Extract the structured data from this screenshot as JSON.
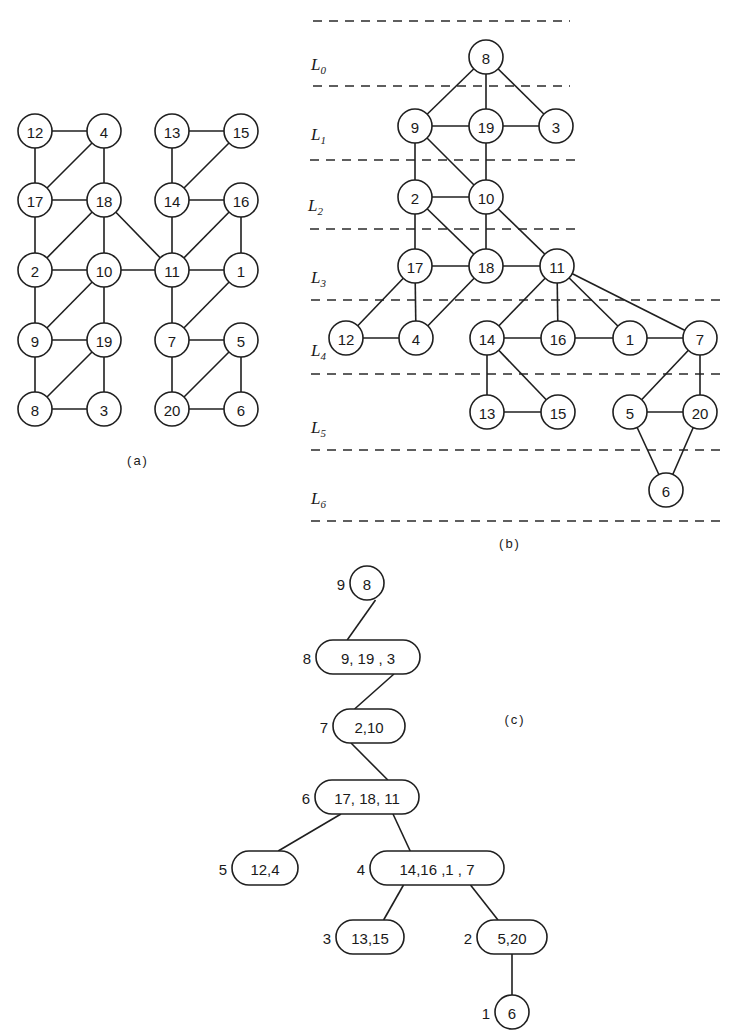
{
  "figure": {
    "panel_a": {
      "caption": "(a)",
      "node_radius": 17,
      "nodes": [
        {
          "id": "12",
          "x": 35,
          "y": 131
        },
        {
          "id": "4",
          "x": 104,
          "y": 131
        },
        {
          "id": "13",
          "x": 172,
          "y": 131
        },
        {
          "id": "15",
          "x": 241,
          "y": 131
        },
        {
          "id": "17",
          "x": 35,
          "y": 200
        },
        {
          "id": "18",
          "x": 104,
          "y": 200
        },
        {
          "id": "14",
          "x": 172,
          "y": 200
        },
        {
          "id": "16",
          "x": 241,
          "y": 200
        },
        {
          "id": "2",
          "x": 35,
          "y": 270
        },
        {
          "id": "10",
          "x": 104,
          "y": 270
        },
        {
          "id": "11",
          "x": 172,
          "y": 270
        },
        {
          "id": "1",
          "x": 241,
          "y": 270
        },
        {
          "id": "9",
          "x": 35,
          "y": 340
        },
        {
          "id": "19",
          "x": 104,
          "y": 340
        },
        {
          "id": "7",
          "x": 172,
          "y": 340
        },
        {
          "id": "5",
          "x": 241,
          "y": 340
        },
        {
          "id": "8",
          "x": 35,
          "y": 409
        },
        {
          "id": "3",
          "x": 104,
          "y": 409
        },
        {
          "id": "20",
          "x": 172,
          "y": 409
        },
        {
          "id": "6",
          "x": 241,
          "y": 409
        }
      ],
      "edges": [
        [
          "12",
          "4"
        ],
        [
          "12",
          "17"
        ],
        [
          "4",
          "17"
        ],
        [
          "4",
          "18"
        ],
        [
          "13",
          "15"
        ],
        [
          "13",
          "14"
        ],
        [
          "15",
          "14"
        ],
        [
          "17",
          "18"
        ],
        [
          "17",
          "2"
        ],
        [
          "18",
          "2"
        ],
        [
          "18",
          "10"
        ],
        [
          "18",
          "11"
        ],
        [
          "14",
          "16"
        ],
        [
          "14",
          "11"
        ],
        [
          "16",
          "11"
        ],
        [
          "16",
          "1"
        ],
        [
          "2",
          "10"
        ],
        [
          "2",
          "9"
        ],
        [
          "10",
          "11"
        ],
        [
          "10",
          "9"
        ],
        [
          "10",
          "19"
        ],
        [
          "11",
          "1"
        ],
        [
          "11",
          "7"
        ],
        [
          "1",
          "7"
        ],
        [
          "9",
          "19"
        ],
        [
          "9",
          "8"
        ],
        [
          "19",
          "8"
        ],
        [
          "19",
          "3"
        ],
        [
          "8",
          "3"
        ],
        [
          "7",
          "5"
        ],
        [
          "7",
          "20"
        ],
        [
          "5",
          "20"
        ],
        [
          "5",
          "6"
        ],
        [
          "20",
          "6"
        ]
      ],
      "caption_pos": {
        "x": 138,
        "y": 465
      }
    },
    "panel_b": {
      "caption": "(b)",
      "caption_pos": {
        "x": 510,
        "y": 548
      },
      "node_radius": 17,
      "level_lines_y": [
        21,
        86,
        160,
        229,
        300,
        374,
        450,
        521
      ],
      "level_lines": [
        {
          "y": 21,
          "x1": 313,
          "x2": 570
        },
        {
          "y": 86,
          "x1": 313,
          "x2": 570
        },
        {
          "y": 160,
          "x1": 310,
          "x2": 578
        },
        {
          "y": 229,
          "x1": 310,
          "x2": 575
        },
        {
          "y": 300,
          "x1": 311,
          "x2": 720
        },
        {
          "y": 374,
          "x1": 311,
          "x2": 720
        },
        {
          "y": 450,
          "x1": 311,
          "x2": 720
        },
        {
          "y": 521,
          "x1": 311,
          "x2": 720
        }
      ],
      "levels": [
        {
          "label": "L",
          "sub": "0",
          "x": 311,
          "y": 70
        },
        {
          "label": "L",
          "sub": "1",
          "x": 311,
          "y": 140
        },
        {
          "label": "L",
          "sub": "2",
          "x": 308,
          "y": 211
        },
        {
          "label": "L",
          "sub": "3",
          "x": 311,
          "y": 283
        },
        {
          "label": "L",
          "sub": "4",
          "x": 311,
          "y": 356
        },
        {
          "label": "L",
          "sub": "5",
          "x": 311,
          "y": 433
        },
        {
          "label": "L",
          "sub": "6",
          "x": 311,
          "y": 504
        }
      ],
      "nodes": [
        {
          "id": "8",
          "x": 486,
          "y": 57
        },
        {
          "id": "9",
          "x": 415,
          "y": 126
        },
        {
          "id": "19",
          "x": 486,
          "y": 126
        },
        {
          "id": "3",
          "x": 556,
          "y": 126
        },
        {
          "id": "2",
          "x": 415,
          "y": 197
        },
        {
          "id": "10",
          "x": 486,
          "y": 197
        },
        {
          "id": "17",
          "x": 415,
          "y": 266
        },
        {
          "id": "18",
          "x": 486,
          "y": 266
        },
        {
          "id": "11",
          "x": 557,
          "y": 266
        },
        {
          "id": "12",
          "x": 346,
          "y": 338
        },
        {
          "id": "4",
          "x": 416,
          "y": 338
        },
        {
          "id": "14",
          "x": 487,
          "y": 338
        },
        {
          "id": "16",
          "x": 558,
          "y": 338
        },
        {
          "id": "1",
          "x": 630,
          "y": 338
        },
        {
          "id": "7",
          "x": 700,
          "y": 338
        },
        {
          "id": "13",
          "x": 487,
          "y": 412
        },
        {
          "id": "15",
          "x": 558,
          "y": 412
        },
        {
          "id": "5",
          "x": 630,
          "y": 412
        },
        {
          "id": "20",
          "x": 700,
          "y": 412
        },
        {
          "id": "6",
          "x": 666,
          "y": 490
        }
      ],
      "edges": [
        [
          "8",
          "9"
        ],
        [
          "8",
          "19"
        ],
        [
          "8",
          "3"
        ],
        [
          "9",
          "19"
        ],
        [
          "19",
          "3"
        ],
        [
          "9",
          "2"
        ],
        [
          "9",
          "10"
        ],
        [
          "19",
          "10"
        ],
        [
          "2",
          "10"
        ],
        [
          "2",
          "17"
        ],
        [
          "2",
          "18"
        ],
        [
          "10",
          "18"
        ],
        [
          "10",
          "11"
        ],
        [
          "17",
          "18"
        ],
        [
          "18",
          "11"
        ],
        [
          "17",
          "12"
        ],
        [
          "17",
          "4"
        ],
        [
          "18",
          "4"
        ],
        [
          "11",
          "14"
        ],
        [
          "11",
          "16"
        ],
        [
          "11",
          "1"
        ],
        [
          "11",
          "7"
        ],
        [
          "12",
          "4"
        ],
        [
          "14",
          "16"
        ],
        [
          "16",
          "1"
        ],
        [
          "1",
          "7"
        ],
        [
          "14",
          "13"
        ],
        [
          "14",
          "15"
        ],
        [
          "13",
          "15"
        ],
        [
          "7",
          "5"
        ],
        [
          "7",
          "20"
        ],
        [
          "5",
          "20"
        ],
        [
          "5",
          "6"
        ],
        [
          "20",
          "6"
        ]
      ]
    },
    "panel_c": {
      "caption": "(c)",
      "caption_pos": {
        "x": 515,
        "y": 724
      },
      "nodes": [
        {
          "id": "c9",
          "level": "9",
          "text": "8",
          "shape": "circle",
          "x": 367,
          "y": 583,
          "w": 34,
          "h": 34
        },
        {
          "id": "c8",
          "level": "8",
          "text": "9, 19 , 3",
          "shape": "pill",
          "x": 368,
          "y": 657,
          "w": 104,
          "h": 34
        },
        {
          "id": "c7",
          "level": "7",
          "text": "2,10",
          "shape": "pill",
          "x": 369,
          "y": 726,
          "w": 72,
          "h": 34
        },
        {
          "id": "c6",
          "level": "6",
          "text": "17, 18, 11",
          "shape": "pill",
          "x": 367,
          "y": 797,
          "w": 104,
          "h": 34
        },
        {
          "id": "c5",
          "level": "5",
          "text": "12,4",
          "shape": "pill",
          "x": 265,
          "y": 868,
          "w": 66,
          "h": 34
        },
        {
          "id": "c4",
          "level": "4",
          "text": "14,16 ,1 , 7",
          "shape": "pill",
          "x": 437,
          "y": 868,
          "w": 134,
          "h": 34
        },
        {
          "id": "c3",
          "level": "3",
          "text": "13,15",
          "shape": "pill",
          "x": 370,
          "y": 937,
          "w": 68,
          "h": 34
        },
        {
          "id": "c2",
          "level": "2",
          "text": "5,20",
          "shape": "pill",
          "x": 512,
          "y": 937,
          "w": 70,
          "h": 34
        },
        {
          "id": "c1",
          "level": "1",
          "text": "6",
          "shape": "circle",
          "x": 512,
          "y": 1012,
          "w": 34,
          "h": 34
        }
      ],
      "edges": [
        [
          "c9",
          "c8"
        ],
        [
          "c8",
          "c7"
        ],
        [
          "c7",
          "c6"
        ],
        [
          "c6",
          "c5"
        ],
        [
          "c6",
          "c4"
        ],
        [
          "c4",
          "c3"
        ],
        [
          "c4",
          "c2"
        ],
        [
          "c2",
          "c1"
        ]
      ]
    }
  }
}
